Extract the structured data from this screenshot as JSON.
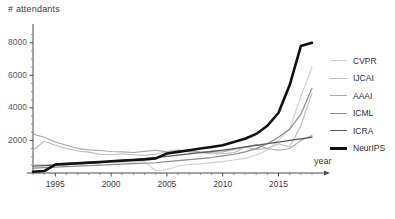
{
  "chart_data": {
    "type": "line",
    "title": "",
    "ylabel": "# attendants",
    "xlabel": "year",
    "xlim": [
      1993,
      2018
    ],
    "ylim": [
      0,
      8600
    ],
    "grid": false,
    "legend_position": "right",
    "yticks": [
      2000,
      4000,
      6000,
      8000
    ],
    "xticks": [
      1995,
      2000,
      2005,
      2010,
      2015
    ],
    "x": [
      1993,
      1994,
      1995,
      1996,
      1997,
      1998,
      1999,
      2000,
      2001,
      2002,
      2003,
      2004,
      2005,
      2006,
      2007,
      2008,
      2009,
      2010,
      2011,
      2012,
      2013,
      2014,
      2015,
      2016,
      2017,
      2018
    ],
    "series": [
      {
        "name": "CVPR",
        "color": "#cfcfcf",
        "width": 1.1,
        "values": [
          500,
          520,
          540,
          560,
          580,
          600,
          620,
          640,
          660,
          680,
          700,
          140,
          200,
          430,
          520,
          560,
          640,
          700,
          800,
          900,
          1100,
          1400,
          2000,
          2700,
          4700,
          6500
        ]
      },
      {
        "name": "IJCAI",
        "color": "#bdbdbd",
        "width": 1.1,
        "values": [
          1400,
          1950,
          1700,
          1500,
          1350,
          1280,
          1150,
          1120,
          1180,
          1120,
          1080,
          1150,
          1320,
          1420,
          1300,
          1250,
          1180,
          1180,
          1250,
          1600,
          1450,
          1500,
          1800,
          1600,
          2900,
          4900
        ]
      },
      {
        "name": "AAAI",
        "color": "#a8a8a8",
        "width": 1.1,
        "values": [
          2400,
          2200,
          1900,
          1700,
          1500,
          1420,
          1380,
          1320,
          1300,
          1260,
          1330,
          1400,
          1300,
          1280,
          1350,
          1300,
          1280,
          1300,
          1450,
          1600,
          1750,
          1500,
          1400,
          1500,
          2000,
          2300
        ]
      },
      {
        "name": "ICML",
        "color": "#8c8c8c",
        "width": 1.2,
        "values": [
          300,
          330,
          360,
          390,
          420,
          450,
          480,
          510,
          540,
          570,
          600,
          630,
          700,
          760,
          820,
          880,
          950,
          1050,
          1150,
          1300,
          1500,
          1800,
          2200,
          2700,
          3600,
          5200
        ]
      },
      {
        "name": "ICRA",
        "color": "#5a5a5a",
        "width": 1.3,
        "values": [
          420,
          450,
          480,
          520,
          560,
          600,
          640,
          700,
          760,
          820,
          880,
          950,
          1020,
          1100,
          1180,
          1250,
          1320,
          1400,
          1500,
          1600,
          1700,
          1800,
          1900,
          2000,
          2100,
          2200
        ]
      },
      {
        "name": "NeurIPS",
        "color": "#111111",
        "width": 2.6,
        "values": [
          80,
          120,
          520,
          560,
          600,
          640,
          680,
          720,
          760,
          800,
          840,
          900,
          1200,
          1300,
          1400,
          1500,
          1600,
          1700,
          1900,
          2100,
          2400,
          2900,
          3700,
          5400,
          7800,
          8000
        ]
      }
    ]
  },
  "legend": {
    "entries": [
      {
        "label": "CVPR"
      },
      {
        "label": "IJCAI"
      },
      {
        "label": "AAAI"
      },
      {
        "label": "ICML"
      },
      {
        "label": "ICRA"
      },
      {
        "label": "NeurIPS"
      }
    ]
  }
}
